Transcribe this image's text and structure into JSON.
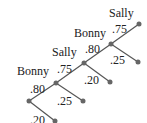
{
  "diagram": {
    "type": "probability-tree",
    "colors": {
      "line": "#555555",
      "node": "#666666",
      "text": "#222222"
    },
    "stages": [
      {
        "player": "Bonny",
        "make": ".80",
        "miss": ".20"
      },
      {
        "player": "Sally",
        "make": ".75",
        "miss": ".25"
      },
      {
        "player": "Bonny",
        "make": ".80",
        "miss": ".20"
      },
      {
        "player": "Sally",
        "make": ".75",
        "miss": ".25"
      }
    ]
  }
}
